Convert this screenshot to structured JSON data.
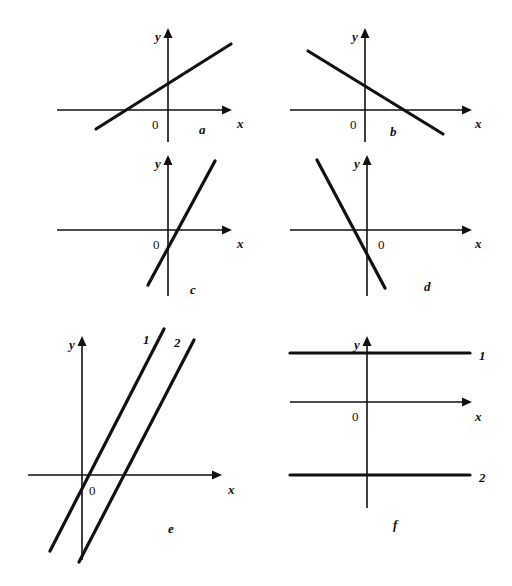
{
  "figure": {
    "width": 512,
    "height": 586,
    "background": "#ffffff",
    "ink_color": "#111111",
    "caption": ""
  },
  "chart_data": {
    "type": "line",
    "title": "",
    "grid": false,
    "legend_position": "inline-line-labels",
    "axis_labels": {
      "x": "x",
      "y": "y",
      "origin": "0"
    },
    "panels": [
      {
        "id": "a",
        "label": "a",
        "origin_px": [
          168,
          110
        ],
        "x_axis": {
          "x1": 57,
          "x2": 232,
          "y": 110,
          "arrow": "right",
          "label": "x",
          "label_px": [
            237,
            117
          ]
        },
        "y_axis": {
          "y1": 28,
          "y2": 142,
          "x": 168,
          "arrow": "up",
          "label": "y",
          "label_px": [
            155,
            30
          ]
        },
        "origin_label_px": [
          152,
          118
        ],
        "label_px": [
          199,
          123
        ],
        "lines": [
          {
            "name": "",
            "slope_sign": "positive",
            "slope": 0.48,
            "y_intercept_sign": "positive",
            "x1": 96,
            "y1": 129,
            "x2": 231,
            "y2": 44
          }
        ]
      },
      {
        "id": "b",
        "label": "b",
        "origin_px": [
          365,
          110
        ],
        "x_axis": {
          "x1": 290,
          "x2": 472,
          "y": 110,
          "arrow": "right",
          "label": "x",
          "label_px": [
            475,
            117
          ]
        },
        "y_axis": {
          "y1": 28,
          "y2": 142,
          "x": 365,
          "arrow": "up",
          "label": "y",
          "label_px": [
            352,
            30
          ]
        },
        "origin_label_px": [
          350,
          118
        ],
        "label_px": [
          390,
          125
        ],
        "lines": [
          {
            "name": "",
            "slope_sign": "negative",
            "slope": -0.62,
            "y_intercept_sign": "positive",
            "x1": 308,
            "y1": 51,
            "x2": 443,
            "y2": 134
          }
        ]
      },
      {
        "id": "c",
        "label": "c",
        "origin_px": [
          168,
          230
        ],
        "x_axis": {
          "x1": 57,
          "x2": 232,
          "y": 230,
          "arrow": "right",
          "label": "x",
          "label_px": [
            237,
            237
          ]
        },
        "y_axis": {
          "y1": 155,
          "y2": 296,
          "x": 168,
          "arrow": "up",
          "label": "y",
          "label_px": [
            155,
            157
          ]
        },
        "origin_label_px": [
          153,
          238
        ],
        "label_px": [
          190,
          283
        ],
        "lines": [
          {
            "name": "",
            "slope_sign": "positive",
            "slope": 1.85,
            "y_intercept_sign": "negative",
            "x1": 148,
            "y1": 285,
            "x2": 215,
            "y2": 161
          }
        ]
      },
      {
        "id": "d",
        "label": "d",
        "origin_px": [
          367,
          230
        ],
        "x_axis": {
          "x1": 290,
          "x2": 472,
          "y": 230,
          "arrow": "right",
          "label": "x",
          "label_px": [
            475,
            237
          ]
        },
        "y_axis": {
          "y1": 155,
          "y2": 296,
          "x": 367,
          "arrow": "up",
          "label": "y",
          "label_px": [
            354,
            157
          ]
        },
        "origin_label_px": [
          378,
          238
        ],
        "label_px": [
          424,
          280
        ],
        "lines": [
          {
            "name": "",
            "slope_sign": "negative",
            "slope": -1.9,
            "y_intercept_sign": "negative",
            "x1": 317,
            "y1": 160,
            "x2": 385,
            "y2": 288
          }
        ]
      },
      {
        "id": "e",
        "label": "e",
        "origin_px": [
          82,
          475
        ],
        "x_axis": {
          "x1": 28,
          "x2": 222,
          "y": 475,
          "arrow": "right",
          "label": "x",
          "label_px": [
            228,
            483
          ]
        },
        "y_axis": {
          "y1": 336,
          "y2": 560,
          "x": 82,
          "arrow": "up",
          "label": "y",
          "label_px": [
            69,
            338
          ]
        },
        "origin_label_px": [
          89,
          484
        ],
        "label_px": [
          168,
          522
        ],
        "lines": [
          {
            "name": "1",
            "slope_sign": "positive",
            "slope": 2.4,
            "y_intercept": 0,
            "x1": 50,
            "y1": 551,
            "x2": 164,
            "y2": 329,
            "label_px": [
              143,
              333
            ]
          },
          {
            "name": "2",
            "slope_sign": "positive",
            "slope": 2.4,
            "y_intercept": "negative",
            "x1": 79,
            "y1": 562,
            "x2": 194,
            "y2": 340,
            "label_px": [
              174,
              336
            ]
          }
        ]
      },
      {
        "id": "f",
        "label": "f",
        "origin_px": [
          367,
          402
        ],
        "x_axis": {
          "x1": 290,
          "x2": 472,
          "y": 402,
          "arrow": "right",
          "label": "x",
          "label_px": [
            475,
            410
          ]
        },
        "y_axis": {
          "y1": 336,
          "y2": 508,
          "x": 367,
          "arrow": "up",
          "label": "y",
          "label_px": [
            354,
            338
          ]
        },
        "origin_label_px": [
          352,
          410
        ],
        "label_px": [
          393,
          518
        ],
        "lines": [
          {
            "name": "1",
            "slope_sign": "zero",
            "slope": 0,
            "y_value": "positive",
            "x1": 290,
            "y1": 353,
            "x2": 470,
            "y2": 353,
            "label_px": [
              479,
              349
            ]
          },
          {
            "name": "2",
            "slope_sign": "zero",
            "slope": 0,
            "y_value": "negative",
            "x1": 290,
            "y1": 475,
            "x2": 470,
            "y2": 475,
            "label_px": [
              479,
              471
            ]
          }
        ]
      }
    ]
  }
}
